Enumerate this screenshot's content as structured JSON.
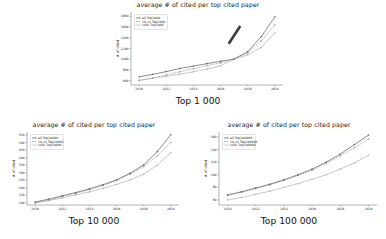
{
  "figure": {
    "background": "#ffffff",
    "shared_title": "average # of cited per top cited paper",
    "ylabel": "# of cited",
    "xlabel": ""
  },
  "chart_data": [
    {
      "id": "top1000",
      "type": "line",
      "title": "average # of cited per top cited paper",
      "caption": "Top 1 000",
      "xlabel": "",
      "ylabel": "# of cited",
      "x": [
        2010,
        2011,
        2012,
        2013,
        2014,
        2015,
        2016,
        2017,
        2018,
        2019,
        2020
      ],
      "xticks": [
        2010,
        2012,
        2014,
        2016,
        2018,
        2020
      ],
      "yticks": [
        600,
        800,
        1000,
        1200,
        1400,
        1600,
        1800
      ],
      "xlim": [
        2009.4,
        2020.6
      ],
      "ylim": [
        520,
        1880
      ],
      "grid": false,
      "legend_position": "upper left",
      "series": [
        {
          "name": "all Top1000",
          "color": "#2b2b2b",
          "style": "solid",
          "marker": "plus",
          "values": [
            672,
            718,
            770,
            828,
            872,
            918,
            962,
            1005,
            1140,
            1420,
            1790
          ]
        },
        {
          "name": "cd_or Top1000",
          "color": "#6e6e6e",
          "style": "dashed",
          "marker": "plus",
          "values": [
            600,
            650,
            706,
            766,
            824,
            880,
            930,
            1002,
            1118,
            1342,
            1640
          ]
        },
        {
          "name": "coor Top1000",
          "color": "#9a9a9a",
          "style": "solid",
          "marker": "plus",
          "values": [
            610,
            646,
            682,
            722,
            766,
            818,
            876,
            1002,
            1080,
            1220,
            1490
          ]
        }
      ],
      "annotations": [
        {
          "type": "bar",
          "name": "trend-highlight-bar",
          "color": "#3a3a3a",
          "x1": 2016.6,
          "y1": 1290,
          "x2": 2017.45,
          "y2": 1620
        }
      ]
    },
    {
      "id": "top10000",
      "type": "line",
      "title": "average # of cited per top cited paper",
      "caption": "Top 10 000",
      "xlabel": "",
      "ylabel": "# of cited",
      "x": [
        2010,
        2011,
        2012,
        2013,
        2014,
        2015,
        2016,
        2017,
        2018,
        2019,
        2020
      ],
      "xticks": [
        2010,
        2012,
        2014,
        2016,
        2018,
        2020
      ],
      "yticks": [
        100,
        150,
        200,
        250,
        300,
        350,
        400,
        450,
        500,
        550
      ],
      "xlim": [
        2009.4,
        2020.6
      ],
      "ylim": [
        85,
        570
      ],
      "grid": false,
      "legend_position": "upper left",
      "series": [
        {
          "name": "all Top10000",
          "color": "#2b2b2b",
          "style": "solid",
          "marker": "plus",
          "values": [
            105,
            124,
            146,
            168,
            192,
            220,
            252,
            296,
            352,
            440,
            552
          ]
        },
        {
          "name": "cd_or Top10000",
          "color": "#6e6e6e",
          "style": "dashed",
          "marker": "plus",
          "values": [
            100,
            118,
            140,
            162,
            186,
            214,
            248,
            290,
            340,
            412,
            500
          ]
        },
        {
          "name": "coor Top10000",
          "color": "#9a9a9a",
          "style": "solid",
          "marker": "plus",
          "values": [
            98,
            114,
            132,
            152,
            172,
            196,
            222,
            252,
            290,
            350,
            432
          ]
        }
      ],
      "annotations": []
    },
    {
      "id": "top100000",
      "type": "line",
      "title": "average # of cited per top cited paper",
      "caption": "Top 100 000",
      "xlabel": "",
      "ylabel": "# of cited",
      "x": [
        2010,
        2011,
        2012,
        2013,
        2014,
        2015,
        2016,
        2017,
        2018,
        2019,
        2020
      ],
      "xticks": [
        2010,
        2012,
        2014,
        2016,
        2018,
        2020
      ],
      "yticks": [
        60,
        80,
        100,
        120,
        140,
        160
      ],
      "xlim": [
        2009.4,
        2020.6
      ],
      "ylim": [
        52,
        168
      ],
      "grid": false,
      "legend_position": "upper left",
      "series": [
        {
          "name": "all Top100000",
          "color": "#2b2b2b",
          "style": "solid",
          "marker": "plus",
          "values": [
            68,
            73,
            79,
            85,
            92,
            100,
            109,
            120,
            133,
            148,
            163
          ]
        },
        {
          "name": "cd_or Top100000",
          "color": "#6e6e6e",
          "style": "dashed",
          "marker": "plus",
          "values": [
            67,
            72,
            78,
            84,
            91,
            99,
            107,
            118,
            130,
            143,
            157
          ]
        },
        {
          "name": "coor Top100000",
          "color": "#9a9a9a",
          "style": "solid",
          "marker": "plus",
          "values": [
            60,
            64,
            69,
            74,
            80,
            86,
            93,
            100,
            109,
            119,
            131
          ]
        }
      ],
      "annotations": []
    }
  ]
}
